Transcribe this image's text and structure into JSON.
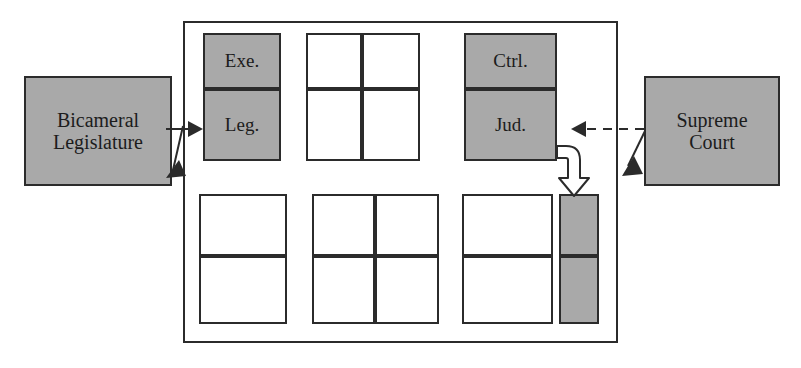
{
  "diagram": {
    "colors": {
      "fill_gray": "#a9a9a9",
      "fill_white": "#ffffff",
      "stroke": "#2b2b2b",
      "background": "#ffffff"
    },
    "outer_frame": {
      "name": "government-frame",
      "label": ""
    },
    "external_entities": [
      {
        "id": "bicameral-legislature",
        "line1": "Bicameral",
        "line2": "Legislature",
        "fill": "#a9a9a9",
        "side": "left"
      },
      {
        "id": "supreme-court",
        "line1": "Supreme",
        "line2": "Court",
        "fill": "#a9a9a9",
        "side": "right"
      }
    ],
    "upper_row": {
      "left_block": {
        "id": "exe-leg-block",
        "columns": 1,
        "rows": 2,
        "cells": [
          {
            "id": "cell-exe",
            "label": "Exe.",
            "fill": "#a9a9a9"
          },
          {
            "id": "cell-leg",
            "label": "Leg.",
            "fill": "#a9a9a9"
          }
        ]
      },
      "middle_block": {
        "id": "upper-middle-block",
        "columns": 2,
        "rows": 2,
        "cells": [
          {
            "id": "cell-um-1",
            "label": "",
            "fill": "#ffffff"
          },
          {
            "id": "cell-um-2",
            "label": "",
            "fill": "#ffffff"
          },
          {
            "id": "cell-um-3",
            "label": "",
            "fill": "#ffffff"
          },
          {
            "id": "cell-um-4",
            "label": "",
            "fill": "#ffffff"
          }
        ]
      },
      "right_block": {
        "id": "ctrl-jud-block",
        "columns": 1,
        "rows": 2,
        "cells": [
          {
            "id": "cell-ctrl",
            "label": "Ctrl.",
            "fill": "#a9a9a9"
          },
          {
            "id": "cell-jud",
            "label": "Jud.",
            "fill": "#a9a9a9"
          }
        ]
      }
    },
    "lower_row": {
      "left_block": {
        "id": "lower-left-block",
        "columns": 1,
        "rows": 2,
        "cells": [
          {
            "id": "cell-ll-1",
            "label": "",
            "fill": "#ffffff"
          },
          {
            "id": "cell-ll-2",
            "label": "",
            "fill": "#ffffff"
          }
        ]
      },
      "middle_block": {
        "id": "lower-middle-block",
        "columns": 2,
        "rows": 2,
        "cells": [
          {
            "id": "cell-lm-1",
            "label": "",
            "fill": "#ffffff"
          },
          {
            "id": "cell-lm-2",
            "label": "",
            "fill": "#ffffff"
          },
          {
            "id": "cell-lm-3",
            "label": "",
            "fill": "#ffffff"
          },
          {
            "id": "cell-lm-4",
            "label": "",
            "fill": "#ffffff"
          }
        ]
      },
      "right_block": {
        "id": "lower-right-block",
        "columns": 1,
        "rows": 2,
        "cells": [
          {
            "id": "cell-lr-1",
            "label": "",
            "fill": "#ffffff"
          },
          {
            "id": "cell-lr-2",
            "label": "",
            "fill": "#ffffff"
          }
        ]
      },
      "gray_column": {
        "id": "lower-gray-column",
        "columns": 1,
        "rows": 2,
        "cells": [
          {
            "id": "cell-gray-1",
            "label": "",
            "fill": "#a9a9a9"
          },
          {
            "id": "cell-gray-2",
            "label": "",
            "fill": "#a9a9a9"
          }
        ]
      }
    },
    "connectors": [
      {
        "id": "legislature-to-leg",
        "style": "solid",
        "head": "filled-triangle",
        "from": "bicameral-legislature",
        "to": "cell-leg",
        "direction": "right"
      },
      {
        "id": "frame-to-legislature",
        "style": "solid",
        "head": "filled-triangle",
        "from": "government-frame",
        "to": "bicameral-legislature",
        "direction": "down-left"
      },
      {
        "id": "supreme-court-to-jud",
        "style": "dashed",
        "head": "filled-triangle",
        "from": "supreme-court",
        "to": "cell-jud",
        "direction": "left"
      },
      {
        "id": "frame-to-supreme-court",
        "style": "solid",
        "head": "filled-triangle",
        "from": "government-frame",
        "to": "supreme-court",
        "direction": "down-right"
      },
      {
        "id": "jud-to-gray-column",
        "style": "block-arrow-curved",
        "head": "hollow-block-arrow",
        "from": "cell-jud",
        "to": "lower-gray-column",
        "direction": "right-then-down"
      }
    ]
  }
}
